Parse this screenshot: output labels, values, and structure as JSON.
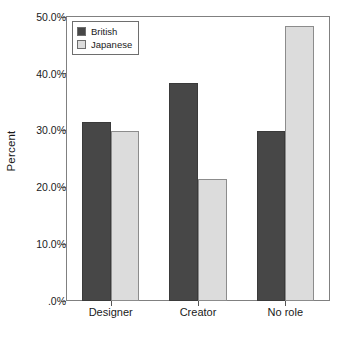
{
  "chart_data": {
    "type": "bar",
    "title": "",
    "subtitle": "",
    "xlabel": "",
    "ylabel": "Percent",
    "categories": [
      "Designer",
      "Creator",
      "No role"
    ],
    "series": [
      {
        "name": "British",
        "color": "#474747",
        "values": [
          31.5,
          38.3,
          29.9
        ]
      },
      {
        "name": "Japanese",
        "color": "#dcdcdc",
        "values": [
          29.9,
          21.4,
          48.4
        ]
      }
    ],
    "ylim": [
      0,
      50
    ],
    "ytick_values": [
      0,
      10,
      20,
      30,
      40,
      50
    ],
    "ytick_labels": [
      ".0%",
      "10.0%",
      "20.0%",
      "30.0%",
      "40.0%",
      "50.0%"
    ],
    "grid": false,
    "legend_position": "top-left",
    "legend_entries": [
      "British",
      "Japanese"
    ],
    "annotations": []
  },
  "axes": {
    "y_title": "Percent"
  },
  "legend": {
    "items": [
      {
        "label": "British"
      },
      {
        "label": "Japanese"
      }
    ]
  }
}
